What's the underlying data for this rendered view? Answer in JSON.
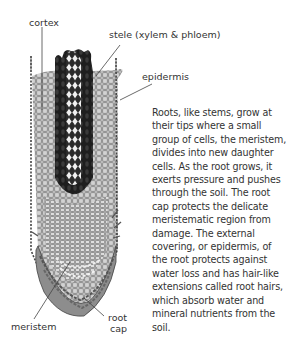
{
  "labels": {
    "cortex": "cortex",
    "stele": "stele (xylem & phloem)",
    "epidermis": "epidermis",
    "meristem": "meristem",
    "root_cap_1": "root",
    "root_cap_2": "cap"
  },
  "description": "Roots, like stems, grow at their tips where a small group of cells, the meristem, divides into new daughter cells. As the root grows, it exerts pressure and pushes through the soil. The root cap protects the delicate meristematic region from damage. The external covering, or epidermis, of the root protects against water loss and has hair-like extensions called root hairs, which absorb water and mineral nutrients from the soil.",
  "colors": {
    "cortex_fill": "#b8b8b8",
    "cell_line": "#6a6a6a",
    "stele_dark": "#222222",
    "stele_light": "#e6e6e6",
    "cap_fill": "#9a9a9a",
    "text": "#333333"
  }
}
